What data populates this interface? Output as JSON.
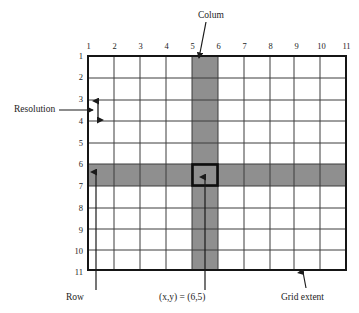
{
  "figure": {
    "kind": "raster-grid-diagram",
    "grid": {
      "gridline_labels_top": [
        "1",
        "2",
        "3",
        "4",
        "5",
        "6",
        "7",
        "8",
        "9",
        "10",
        "11"
      ],
      "gridline_labels_left": [
        "1",
        "2",
        "3",
        "4",
        "5",
        "6",
        "7",
        "8",
        "9",
        "10",
        "11"
      ],
      "columns": 10,
      "rows": 10,
      "highlight_column_index": 5,
      "highlight_row_index": 6,
      "selected_cell": {
        "x": 6,
        "y": 5
      }
    },
    "callouts": {
      "column": "Colum",
      "resolution": "Resolution",
      "row": "Row",
      "cell_coordinate": "(x,y) = (6,5)",
      "grid_extent": "Grid extent"
    },
    "colors": {
      "shading": "#8f8f8f",
      "gridline": "#3d3d3d",
      "border": "#151515",
      "ink": "#1d1d1d",
      "background": "#ffffff"
    }
  }
}
